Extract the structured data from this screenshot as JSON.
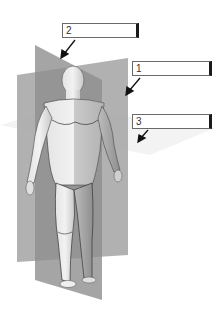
{
  "diagram": {
    "planes": [
      {
        "id": "plane-1",
        "kind": "frontal",
        "color": "#9a9a9a"
      },
      {
        "id": "plane-2",
        "kind": "sagittal",
        "color": "#8c8c8c"
      },
      {
        "id": "plane-3",
        "kind": "transverse",
        "color": "#f2f2f2"
      }
    ],
    "labels": [
      {
        "number": "1",
        "answer": ""
      },
      {
        "number": "2",
        "answer": ""
      },
      {
        "number": "3",
        "answer": ""
      }
    ]
  }
}
